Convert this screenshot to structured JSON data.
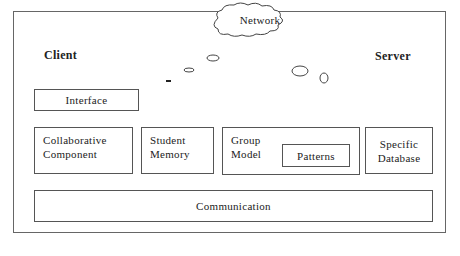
{
  "diagram": {
    "client_label": "Client",
    "server_label": "Server",
    "network_label": "Network",
    "interface_label": "Interface",
    "components": {
      "collaborative": "Collaborative\nComponent",
      "student_memory": "Student\nMemory",
      "group_model": "Group\nModel",
      "patterns": "Patterns",
      "specific_database": "Specific\nDatabase"
    },
    "communication_label": "Communication"
  }
}
